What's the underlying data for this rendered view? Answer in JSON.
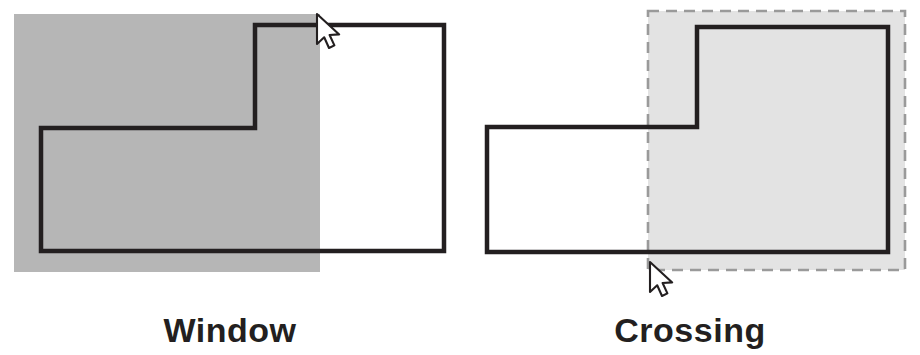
{
  "figure": {
    "width": 920,
    "height": 355,
    "background": "#ffffff"
  },
  "colors": {
    "outline": "#231f20",
    "window_selection_fill": "#b6b6b6",
    "crossing_selection_fill": "#e3e3e3",
    "crossing_selection_border": "#9a9a9a",
    "cursor_fill": "#ffffff",
    "cursor_stroke": "#231f20",
    "caption_text": "#231f20",
    "page_background": "#ffffff"
  },
  "panels": [
    {
      "id": "window",
      "caption": "Window",
      "selection_type": "window",
      "selection_border_style": "solid-none",
      "description": "Solid gray selection rectangle drawn left-to-right; only fully enclosed objects are selected.",
      "selection_rect": {
        "x": 14,
        "y": 14,
        "width": 306,
        "height": 258
      },
      "shape_label": "L-shaped outline",
      "shape_points": "41,128 255,128 255,25 444,25 444,251 41,251",
      "cursor": {
        "x": 317,
        "y": 14,
        "rotation": 0,
        "position": "top-right of selection box"
      }
    },
    {
      "id": "crossing",
      "caption": "Crossing",
      "selection_type": "crossing",
      "selection_border_style": "dashed",
      "description": "Dashed gray selection rectangle drawn right-to-left; objects touched or enclosed are selected.",
      "selection_rect": {
        "x": 648,
        "y": 11,
        "width": 257,
        "height": 259
      },
      "shape_label": "L-shaped outline",
      "shape_points": "487,127 697,127 697,27 888,27 888,252 487,252",
      "cursor": {
        "x": 650,
        "y": 262,
        "rotation": 0,
        "position": "bottom-left of selection box"
      }
    }
  ],
  "icons": {
    "cursor": "mouse-pointer-arrow-icon"
  }
}
